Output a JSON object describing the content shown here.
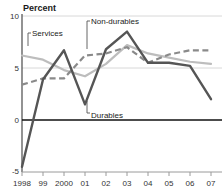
{
  "chart_data": {
    "type": "line",
    "title": "",
    "ylabel": "Percent",
    "xlabel": "",
    "ylim": [
      -5,
      10
    ],
    "yticks": [
      -5,
      0,
      5,
      10
    ],
    "ytick_labels": [
      "-5",
      "0",
      "5",
      "10"
    ],
    "grid": true,
    "legend": "inline-annotations",
    "x": [
      1998,
      1999,
      2000,
      2001,
      2002,
      2003,
      2004,
      2005,
      2006,
      2007
    ],
    "categories": [
      "1998",
      "99",
      "2000",
      "01",
      "02",
      "03",
      "04",
      "05",
      "06",
      "07"
    ],
    "series": [
      {
        "name": "Durables",
        "style": "solid-dark",
        "color": "#555555",
        "values": [
          -4.5,
          3.9,
          6.7,
          1.5,
          6.8,
          8.5,
          5.5,
          5.5,
          5.2,
          2.0
        ]
      },
      {
        "name": "Non-durables",
        "style": "dashed-gray",
        "color": "#8a8a8a",
        "values": [
          3.4,
          4.0,
          4.0,
          6.2,
          6.4,
          7.0,
          5.5,
          6.3,
          6.7,
          6.7
        ]
      },
      {
        "name": "Services",
        "style": "solid-light",
        "color": "#bdbdbd",
        "values": [
          6.2,
          5.8,
          4.8,
          4.2,
          5.4,
          7.2,
          6.4,
          6.0,
          5.6,
          5.4
        ]
      }
    ],
    "annotations": [
      {
        "label": "Services",
        "x_px": 33,
        "y_px": 31
      },
      {
        "label": "Non-durables",
        "x_px": 91,
        "y_px": 19
      },
      {
        "label": "Durables",
        "x_px": 91,
        "y_px": 115
      }
    ]
  }
}
